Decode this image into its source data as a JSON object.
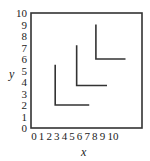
{
  "chart_data": {
    "type": "line",
    "title": "",
    "xlabel": "x",
    "ylabel": "y",
    "xlim": [
      0,
      14
    ],
    "ylim": [
      0,
      10
    ],
    "grid": false,
    "legend": null,
    "x_ticks": [
      "0",
      "1",
      "2",
      "3",
      "4",
      "5",
      "6",
      "7",
      "8",
      "9",
      "10"
    ],
    "y_ticks": [
      "0",
      "1",
      "2",
      "3",
      "4",
      "5",
      "6",
      "7",
      "8",
      "9",
      "10"
    ],
    "series": [
      {
        "name": "L-curve 1",
        "points": [
          [
            3,
            5.5
          ],
          [
            3,
            2
          ],
          [
            7.6,
            2
          ]
        ]
      },
      {
        "name": "L-curve 2",
        "points": [
          [
            5.9,
            7.2
          ],
          [
            5.9,
            3.7
          ],
          [
            10,
            3.7
          ]
        ]
      },
      {
        "name": "L-curve 3",
        "points": [
          [
            8.5,
            9
          ],
          [
            8.5,
            6
          ],
          [
            12.5,
            6
          ]
        ]
      }
    ],
    "colors": {
      "line": "#333333",
      "frame": "#333333"
    }
  },
  "labels": {
    "x_axis": "x",
    "y_axis": "y"
  }
}
